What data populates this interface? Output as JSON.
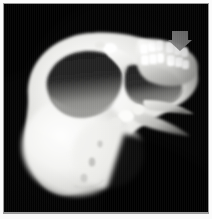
{
  "figure": {
    "modality": "CT",
    "render_type": "3D volume rendering",
    "view": "oblique superior-anterior, rotated",
    "background_color": "#030303",
    "bone_color": "#f4f4f2",
    "bone_shadow_color": "#6f6f6d",
    "frame_color": "#fbfbfb",
    "frame_line_color": "#9a9a9a"
  },
  "annotations": [
    {
      "name": "downward-arrow-marker",
      "shape": "solid down arrow",
      "color": "#8d8d8d",
      "points_at": "maxillary dentition",
      "x": 167,
      "y": 30,
      "width": 20,
      "height": 16
    }
  ],
  "anatomy": [
    {
      "id": "cranial-vault",
      "label": "cranial vault",
      "tone": "#f6f6f4"
    },
    {
      "id": "left-orbit",
      "label": "left orbital cavity",
      "tone": "#2a2a2a"
    },
    {
      "id": "right-orbit",
      "label": "right orbital cavity",
      "tone": "#2f2f2f"
    },
    {
      "id": "orbital-floor",
      "label": "orbital floor",
      "tone": "#8b8b89"
    },
    {
      "id": "nasal-bridge",
      "label": "nasal bridge",
      "tone": "#fbfbfa"
    },
    {
      "id": "zygomatic-arch",
      "label": "zygomatic arch",
      "tone": "#d8d8d5"
    },
    {
      "id": "maxilla",
      "label": "maxilla",
      "tone": "#ededea"
    },
    {
      "id": "upper-teeth",
      "label": "upper dental arch",
      "tone": "#ffffff"
    },
    {
      "id": "lower-teeth",
      "label": "lower dental arch",
      "tone": "#fdfdfd"
    },
    {
      "id": "mandible-ramus",
      "label": "mandibular ramus",
      "tone": "#c9c9c6"
    },
    {
      "id": "temporal-bone",
      "label": "temporal bone",
      "tone": "#f2f2f0"
    },
    {
      "id": "occipital-region",
      "label": "occipital region",
      "tone": "#e9e9e6"
    }
  ],
  "teeth": {
    "upper_row": [
      {
        "x": 140,
        "y": 44,
        "w": 8,
        "h": 10
      },
      {
        "x": 148,
        "y": 42,
        "w": 8,
        "h": 10
      },
      {
        "x": 156,
        "y": 41,
        "w": 7,
        "h": 10
      },
      {
        "x": 166,
        "y": 42,
        "w": 8,
        "h": 11
      },
      {
        "x": 174,
        "y": 44,
        "w": 8,
        "h": 11
      },
      {
        "x": 181,
        "y": 47,
        "w": 7,
        "h": 10
      }
    ],
    "lower_row": [
      {
        "x": 141,
        "y": 55,
        "w": 8,
        "h": 10
      },
      {
        "x": 149,
        "y": 54,
        "w": 8,
        "h": 10
      },
      {
        "x": 157,
        "y": 53,
        "w": 7,
        "h": 10
      },
      {
        "x": 167,
        "y": 55,
        "w": 8,
        "h": 11
      },
      {
        "x": 175,
        "y": 57,
        "w": 8,
        "h": 10
      },
      {
        "x": 182,
        "y": 60,
        "w": 7,
        "h": 9
      }
    ]
  }
}
